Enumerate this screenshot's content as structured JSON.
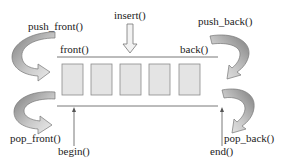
{
  "diagram": {
    "title": "",
    "colors": {
      "box_fill": "#e4e4e4",
      "box_stroke": "#8a8a8a",
      "line": "#555555",
      "curved_arrow_dark": "#8c8c8c",
      "curved_arrow_light": "#e8e8e8",
      "text": "#222222"
    },
    "elements_count": 5,
    "labels": {
      "push_front": "push_front()",
      "front": "front()",
      "insert": "insert()",
      "push_back": "push_back()",
      "back": "back()",
      "pop_front": "pop_front()",
      "begin": "begin()",
      "pop_back": "pop_back()",
      "end": "end()"
    },
    "arrows": [
      {
        "name": "push_front",
        "type": "curved",
        "direction": "into-front"
      },
      {
        "name": "push_back",
        "type": "curved",
        "direction": "into-back"
      },
      {
        "name": "pop_front",
        "type": "curved",
        "direction": "out-of-front"
      },
      {
        "name": "pop_back",
        "type": "curved",
        "direction": "out-of-back"
      },
      {
        "name": "insert",
        "type": "straight-hollow",
        "direction": "down"
      },
      {
        "name": "begin",
        "type": "thin-line",
        "direction": "up"
      },
      {
        "name": "end",
        "type": "thin-line",
        "direction": "up"
      }
    ]
  }
}
